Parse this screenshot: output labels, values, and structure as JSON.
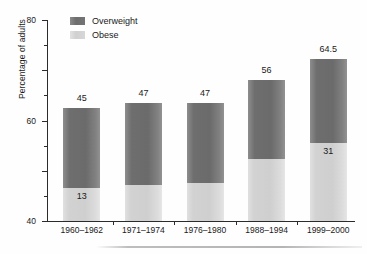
{
  "chart_data": {
    "type": "bar",
    "subtype": "stacked-bar",
    "title": "",
    "xlabel": "",
    "ylabel": "Percentage of adults",
    "ylim": [
      0,
      80
    ],
    "ytick_labels": [
      "0",
      "20",
      "40",
      "60",
      "80"
    ],
    "yticks": [
      0,
      20,
      40,
      60,
      80
    ],
    "yticks_minor": [
      10,
      30,
      50,
      70
    ],
    "grid": false,
    "legend_position": "top-left",
    "categories": [
      "1960–1962",
      "1971–1974",
      "1976–1980",
      "1988–1994",
      "1999–2000"
    ],
    "series": [
      {
        "name": "Obese",
        "color": "#d2d2d2",
        "values": [
          13,
          14.5,
          15,
          24.5,
          31
        ],
        "labels": [
          "13",
          "",
          "",
          "",
          "31"
        ]
      },
      {
        "name": "Overweight",
        "color": "#6e6e6e",
        "values": [
          32,
          32.5,
          32,
          31.5,
          33.5
        ],
        "labels": [
          "",
          "",
          "",
          "",
          ""
        ]
      }
    ],
    "totals": [
      45,
      47,
      47,
      56,
      64.5
    ],
    "total_labels": [
      "45",
      "47",
      "47",
      "56",
      "64.5"
    ]
  },
  "legend": {
    "items": [
      {
        "label": "Overweight",
        "swatch": "dark-gray-swatch"
      },
      {
        "label": "Obese",
        "swatch": "light-gray-swatch"
      }
    ]
  },
  "axes": {
    "y_title": "Percentage of adults"
  }
}
